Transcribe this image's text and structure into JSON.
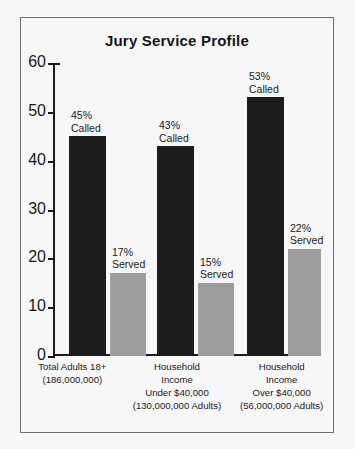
{
  "chart_data": {
    "type": "bar",
    "title": "Jury Service Profile",
    "xlabel": "",
    "ylabel": "",
    "ylim": [
      0,
      60
    ],
    "yticks": [
      0,
      10,
      20,
      30,
      40,
      50,
      60
    ],
    "grid": false,
    "legend": "none",
    "categories": [
      "Total Adults 18+ (186,000,000)",
      "Household Income Under $40,000 (130,000,000 Adults)",
      "Household Income Over $40,000 (56,000,000 Adults)"
    ],
    "series": [
      {
        "name": "Called",
        "values": [
          45,
          43,
          53
        ],
        "color": "#1c1c1c"
      },
      {
        "name": "Served",
        "values": [
          17,
          15,
          22
        ],
        "color": "#9d9d9d"
      }
    ]
  },
  "title": "Jury Service Profile",
  "axis": {
    "ticks": [
      {
        "label": "60",
        "value": 60
      },
      {
        "label": "50",
        "value": 50
      },
      {
        "label": "40",
        "value": 40
      },
      {
        "label": "30",
        "value": 30
      },
      {
        "label": "20",
        "value": 20
      },
      {
        "label": "10",
        "value": 10
      },
      {
        "label": "0",
        "value": 0
      }
    ]
  },
  "groups": [
    {
      "lines": [
        "Total Adults 18+",
        "(186,000,000)",
        "",
        ""
      ],
      "bars": [
        {
          "kind": "called",
          "value": 45,
          "pct": "45%",
          "word": "Called"
        },
        {
          "kind": "served",
          "value": 17,
          "pct": "17%",
          "word": "Served"
        }
      ]
    },
    {
      "lines": [
        "Household",
        "Income",
        "Under $40,000",
        "(130,000,000 Adults)"
      ],
      "bars": [
        {
          "kind": "called",
          "value": 43,
          "pct": "43%",
          "word": "Called"
        },
        {
          "kind": "served",
          "value": 15,
          "pct": "15%",
          "word": "Served"
        }
      ]
    },
    {
      "lines": [
        "Household",
        "Income",
        "Over $40,000",
        "(56,000,000 Adults)"
      ],
      "bars": [
        {
          "kind": "called",
          "value": 53,
          "pct": "53%",
          "word": "Called"
        },
        {
          "kind": "served",
          "value": 22,
          "pct": "22%",
          "word": "Served"
        }
      ]
    }
  ],
  "colors": {
    "called": "#1c1c1c",
    "served": "#9d9d9d",
    "frame": "#6e6e6e",
    "background": "#f7f7f7",
    "text": "#1a1a1a"
  }
}
